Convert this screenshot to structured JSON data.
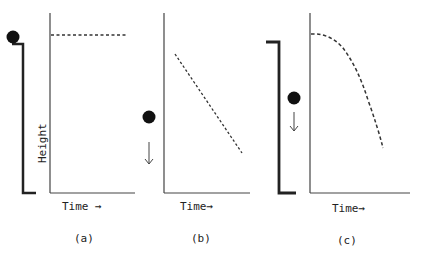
{
  "colors": {
    "ink": "#222222",
    "background": "#ffffff"
  },
  "panels": [
    {
      "id": "a",
      "caption": "(a)",
      "xlabel": "Time →",
      "ylabel": "Height",
      "description": "Ball resting on top of tower; height constant over time",
      "curve": "horizontal-dashed-line"
    },
    {
      "id": "b",
      "caption": "(b)",
      "xlabel": "Time→",
      "ylabel": "",
      "description": "Ball falling at constant velocity; height decreases linearly",
      "curve": "linear-decreasing-dashed-line"
    },
    {
      "id": "c",
      "caption": "(c)",
      "xlabel": "Time→",
      "ylabel": "",
      "description": "Ball dropped from tower; height decreases parabolically (accelerating)",
      "curve": "parabolic-decreasing-dashed-curve"
    }
  ]
}
